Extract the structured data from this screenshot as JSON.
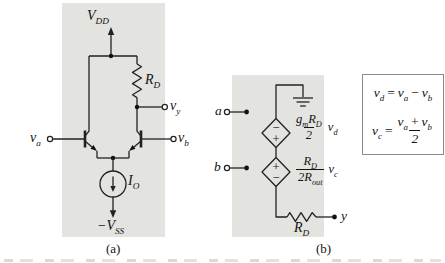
{
  "figure": {
    "captions": {
      "a": "(a)",
      "b": "(b)"
    },
    "colors": {
      "panel_background": "#e3e3e0",
      "line": "#222222",
      "text": "#131313"
    },
    "panel_a": {
      "supply_top": {
        "base": "V",
        "sub": "DD"
      },
      "supply_bottom": {
        "base": "−V",
        "sub": "SS"
      },
      "input_left": {
        "base": "v",
        "sub": "a"
      },
      "input_right": {
        "base": "v",
        "sub": "b"
      },
      "output": {
        "base": "v",
        "sub": "y"
      },
      "resistor": {
        "base": "R",
        "sub": "D"
      },
      "current_source": {
        "base": "I",
        "sub": "O"
      }
    },
    "panel_b": {
      "terminal_a": "a",
      "terminal_b": "b",
      "terminal_y": "y",
      "source1": {
        "sign_top": "−",
        "sign_bottom": "+",
        "num_g": "g",
        "num_g_sub": "m",
        "num_r": "R",
        "num_r_sub": "D",
        "den": "2",
        "ctrl": "v",
        "ctrl_sub": "d"
      },
      "source2": {
        "sign_top": "+",
        "sign_bottom": "−",
        "num": "R",
        "num_sub": "D",
        "den_coef": "2",
        "den_r": "R",
        "den_r_sub": "out",
        "ctrl": "v",
        "ctrl_sub": "c"
      },
      "resistor": {
        "base": "R",
        "sub": "D"
      }
    },
    "equations": {
      "eq1": {
        "lhs": "v",
        "lhs_sub": "d",
        "equals": "=",
        "t1": "v",
        "t1_sub": "a",
        "op": "−",
        "t2": "v",
        "t2_sub": "b"
      },
      "eq2": {
        "lhs": "v",
        "lhs_sub": "c",
        "equals": "=",
        "num1": "v",
        "num1_sub": "a",
        "op": "+",
        "num2": "v",
        "num2_sub": "b",
        "den": "2"
      }
    }
  }
}
